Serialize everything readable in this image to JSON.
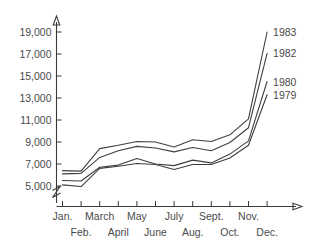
{
  "chart_data": {
    "type": "line",
    "title": "",
    "xlabel": "",
    "ylabel": "",
    "x": [
      "Jan.",
      "Feb.",
      "March",
      "April",
      "May",
      "June",
      "July",
      "Aug.",
      "Sept.",
      "Oct.",
      "Nov.",
      "Dec."
    ],
    "ylim": [
      5000,
      19000
    ],
    "yticks": [
      5000,
      7000,
      9000,
      11000,
      13000,
      15000,
      17000,
      19000
    ],
    "ytick_labels": [
      "5,000",
      "7,000",
      "9,000",
      "11,000",
      "13,000",
      "15,000",
      "17,000",
      "19,000"
    ],
    "xtick_labels_upper": [
      "Jan.",
      "March",
      "May",
      "July",
      "Sept.",
      "Nov."
    ],
    "xtick_labels_lower": [
      "Feb.",
      "April",
      "June",
      "Aug.",
      "Oct.",
      "Dec."
    ],
    "grid": false,
    "legend_position": "right-inline",
    "y_axis_break": true,
    "series": [
      {
        "name": "1983",
        "label": "1983",
        "values": [
          6400,
          6350,
          8400,
          8700,
          9050,
          9000,
          8550,
          9200,
          9050,
          9650,
          11100,
          19000
        ]
      },
      {
        "name": "1982",
        "label": "1982",
        "values": [
          6100,
          6150,
          7600,
          8200,
          8600,
          8450,
          8100,
          8500,
          8200,
          8950,
          10300,
          17050
        ]
      },
      {
        "name": "1980",
        "label": "1980",
        "values": [
          5500,
          5450,
          6700,
          6900,
          7500,
          7000,
          6850,
          7350,
          7100,
          7900,
          9100,
          14500
        ]
      },
      {
        "name": "1979",
        "label": "1979",
        "values": [
          5100,
          4950,
          6600,
          6800,
          7050,
          6950,
          6500,
          6950,
          6950,
          7550,
          8700,
          13300
        ]
      }
    ]
  },
  "axes": {
    "y_break_name": "axis-break",
    "x_axis_name": "x-axis",
    "y_axis_name": "y-axis"
  }
}
